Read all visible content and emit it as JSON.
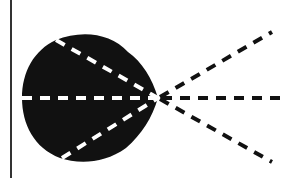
{
  "diagram": {
    "title": "",
    "colors": {
      "background": "#ffffff",
      "blob": "#111111",
      "inner_rays": "#ffffff",
      "outer_rays": "#111111",
      "border_line": "#333333"
    },
    "focal_point": {
      "x": 158,
      "y": 98
    },
    "border_line": {
      "x": 11,
      "y1": 0,
      "y2": 178
    },
    "inner_rays": [
      {
        "name": "upper",
        "from": [
          56,
          40
        ]
      },
      {
        "name": "middle",
        "from": [
          22,
          98
        ]
      },
      {
        "name": "lower",
        "from": [
          62,
          158
        ]
      }
    ],
    "outer_rays": [
      {
        "name": "upper",
        "to": [
          272,
          32
        ]
      },
      {
        "name": "middle",
        "to": [
          284,
          98
        ]
      },
      {
        "name": "lower",
        "to": [
          272,
          162
        ]
      }
    ]
  }
}
